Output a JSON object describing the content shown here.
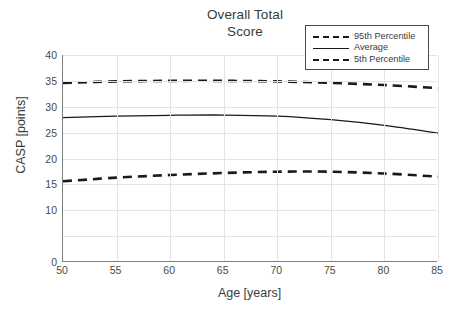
{
  "chart_data": {
    "type": "line",
    "title": "Overall Total Score",
    "title_lines": [
      "Overall Total",
      "Score"
    ],
    "xlabel": "Age [years]",
    "ylabel": "CASP [points]",
    "xlim": [
      50,
      85
    ],
    "ylim": [
      0,
      40
    ],
    "xticks": [
      50,
      55,
      60,
      65,
      70,
      75,
      80,
      85
    ],
    "yticks": [
      0,
      10,
      15,
      20,
      25,
      30,
      35,
      40
    ],
    "ytick_labels": [
      "0",
      "10",
      "15",
      "20",
      "25",
      "30",
      "35",
      "40"
    ],
    "ygrid_values": [
      0,
      5,
      10,
      15,
      20,
      25,
      30,
      35,
      40
    ],
    "grid": true,
    "legend_position": "top-right",
    "x": [
      50,
      55,
      60,
      65,
      70,
      75,
      80,
      85
    ],
    "series": [
      {
        "name": "95th Percentile",
        "style": "dashed",
        "color": "#1a1a1a",
        "values": [
          34.6,
          34.9,
          35.0,
          35.0,
          34.9,
          34.6,
          34.2,
          33.6
        ]
      },
      {
        "name": "Average",
        "style": "solid",
        "color": "#1a1a1a",
        "values": [
          27.9,
          28.2,
          28.35,
          28.4,
          28.2,
          27.5,
          26.4,
          24.9
        ]
      },
      {
        "name": "5th Percentile",
        "style": "dashed",
        "color": "#1a1a1a",
        "values": [
          15.6,
          16.3,
          16.8,
          17.2,
          17.45,
          17.45,
          17.1,
          16.5
        ]
      }
    ]
  },
  "legend": {
    "entries": [
      {
        "label": "95th Percentile",
        "swatch": "dashed-wide"
      },
      {
        "label": "Average",
        "swatch": "solid"
      },
      {
        "label": "5th Percentile",
        "swatch": "dashed-tight"
      }
    ]
  },
  "colors": {
    "line": "#1a1a1a",
    "grid": "#e4e4e4",
    "axis": "#7f7f7f",
    "text": "#3a3a3a",
    "background": "#ffffff"
  }
}
